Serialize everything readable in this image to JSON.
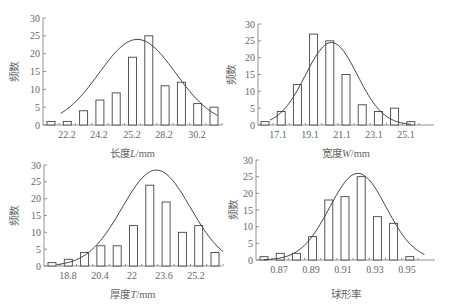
{
  "chart_data": [
    {
      "type": "bar",
      "subtype": "histogram_with_normal_fit",
      "title": "",
      "xlabel": "长度L/mm",
      "ylabel": "频数",
      "ylim": [
        0,
        30
      ],
      "yticks": [
        "0",
        "5",
        "10",
        "15",
        "20",
        "25",
        "30"
      ],
      "xticks": [
        "22.2",
        "24.2",
        "25.2",
        "28.2",
        "30.2"
      ],
      "values": [
        1,
        1,
        4,
        7,
        9,
        19,
        25,
        11,
        12,
        6,
        5
      ],
      "curve_peak": 24,
      "grid": false
    },
    {
      "type": "bar",
      "subtype": "histogram_with_normal_fit",
      "title": "",
      "xlabel": "宽度W/mm",
      "ylabel": "频数",
      "ylim": [
        0,
        30
      ],
      "yticks": [
        "0",
        "5",
        "10",
        "15",
        "20",
        "25",
        "30"
      ],
      "xticks": [
        "17.1",
        "19.1",
        "21.1",
        "23.1",
        "25.1"
      ],
      "values": [
        1,
        4,
        12,
        27,
        25,
        15,
        6,
        4,
        5,
        1
      ],
      "curve_peak": 24.5,
      "grid": false
    },
    {
      "type": "bar",
      "subtype": "histogram_with_normal_fit",
      "title": "",
      "xlabel": "厚度T/mm",
      "ylabel": "频数",
      "ylim": [
        0,
        30
      ],
      "yticks": [
        "0",
        "5",
        "10",
        "15",
        "20",
        "25",
        "30"
      ],
      "xticks": [
        "18.8",
        "20.4",
        "22",
        "23.6",
        "25.2"
      ],
      "values": [
        1,
        2,
        4,
        6,
        6,
        12,
        24,
        19,
        10,
        12,
        4
      ],
      "curve_peak": 28.5,
      "grid": false
    },
    {
      "type": "bar",
      "subtype": "histogram_with_normal_fit",
      "title": "",
      "xlabel": "球形率",
      "ylabel": "频数",
      "ylim": [
        0,
        30
      ],
      "yticks": [
        "0",
        "5",
        "10",
        "15",
        "20",
        "25",
        "30"
      ],
      "xticks": [
        "0.87",
        "0.89",
        "0.91",
        "0.93",
        "0.95"
      ],
      "values": [
        1,
        2,
        2,
        7,
        18,
        19,
        25,
        13,
        11,
        1
      ],
      "curve_peak": 26,
      "grid": false
    }
  ],
  "panels": [
    {
      "ylabel": "频数",
      "xlabel_pre": "长度",
      "xlabel_var": "L",
      "xlabel_post": "/mm"
    },
    {
      "ylabel": "频数",
      "xlabel_pre": "宽度",
      "xlabel_var": "W",
      "xlabel_post": "/mm"
    },
    {
      "ylabel": "频数",
      "xlabel_pre": "厚度",
      "xlabel_var": "T",
      "xlabel_post": "/mm"
    },
    {
      "ylabel": "频数",
      "xlabel_pre": "球形率",
      "xlabel_var": "",
      "xlabel_post": ""
    }
  ]
}
